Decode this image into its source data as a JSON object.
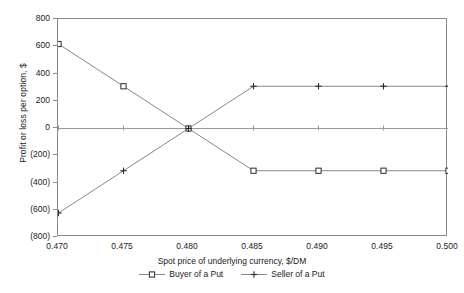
{
  "chart_data": {
    "type": "line",
    "title": "",
    "xlabel": "Spot price of underlying currency, $/DM",
    "ylabel": "Profit or loss per option, $",
    "categories": [
      "0.470",
      "0.475",
      "0.480",
      "0.485",
      "0.490",
      "0.495",
      "0.500"
    ],
    "x": [
      0.47,
      0.475,
      0.48,
      0.485,
      0.49,
      0.495,
      0.5
    ],
    "xlim": [
      0.47,
      0.5
    ],
    "ylim": [
      -800,
      800
    ],
    "ytick_labels": [
      "800",
      "600",
      "400",
      "200",
      "0",
      "(200)",
      "(400)",
      "(600)",
      "(800)"
    ],
    "ytick_values": [
      800,
      600,
      400,
      200,
      0,
      -200,
      -400,
      -600,
      -800
    ],
    "grid": false,
    "zero_line": true,
    "legend_position": "bottom",
    "series": [
      {
        "name": "Buyer of a Put",
        "marker": "square-open",
        "color": "#3c3c3c",
        "values": [
          620,
          310,
          0,
          -310,
          -310,
          -310,
          -310
        ]
      },
      {
        "name": "Seller of a Put",
        "marker": "plus",
        "color": "#3c3c3c",
        "values": [
          -620,
          -310,
          0,
          310,
          310,
          310,
          310
        ]
      }
    ]
  },
  "colors": {
    "axis": "#8a8a8a",
    "zero_line": "#9a9a9a",
    "line": "#7a7a7a",
    "marker": "#2b2b2b",
    "text": "#1b1b1b",
    "background": "#ffffff"
  }
}
